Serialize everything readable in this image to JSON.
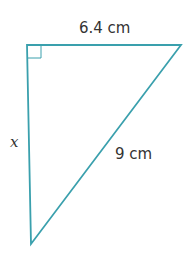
{
  "diagram": {
    "type": "right-triangle",
    "stroke_color": "#3aa0ad",
    "labels": {
      "top_side": "6.4 cm",
      "left_side": "x",
      "hypotenuse": "9 cm"
    },
    "right_angle_marker": "top-left"
  }
}
